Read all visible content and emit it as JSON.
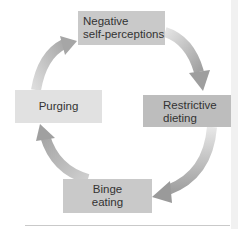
{
  "diagram": {
    "type": "cycle",
    "nodes": [
      {
        "id": "negative",
        "lines": [
          "Negative",
          "self-perceptions"
        ],
        "color": "#c9c9c9"
      },
      {
        "id": "restrictive",
        "lines": [
          "Restrictive",
          "dieting"
        ],
        "color": "#bdbdbd"
      },
      {
        "id": "binge",
        "lines": [
          "Binge",
          "eating"
        ],
        "color": "#c9c9c9"
      },
      {
        "id": "purging",
        "lines": [
          "Purging"
        ],
        "color": "#e1e1e1"
      }
    ],
    "edges": [
      {
        "from": "negative",
        "to": "restrictive"
      },
      {
        "from": "restrictive",
        "to": "binge"
      },
      {
        "from": "binge",
        "to": "purging"
      },
      {
        "from": "purging",
        "to": "negative"
      }
    ],
    "arrow_color": "#a9a9a9"
  }
}
